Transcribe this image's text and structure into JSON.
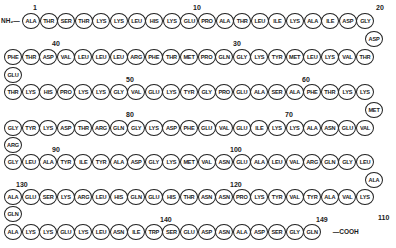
{
  "n_terminus": "NH₂—",
  "c_terminus": "—COOH",
  "rows": [
    {
      "y": 21,
      "residues": [
        "ALA",
        "THR",
        "SER",
        "THR",
        "LYS",
        "LYS",
        "LEU",
        "HIS",
        "LYS",
        "GLU",
        "PRO",
        "ALA",
        "THR",
        "LEU",
        "ILE",
        "LYS",
        "ALA",
        "ILE",
        "ASP",
        "GLY"
      ]
    },
    {
      "y": 57,
      "residues": [
        "PHE",
        "THR",
        "ASP",
        "VAL",
        "LEU",
        "LEU",
        "LEU",
        "ARG",
        "PHE",
        "THR",
        "MET",
        "PRO",
        "GLN",
        "GLY",
        "LYS",
        "TYR",
        "MET",
        "LEU",
        "LYS",
        "VAL",
        "THR"
      ]
    },
    {
      "y": 92,
      "residues": [
        "THR",
        "LYS",
        "HIS",
        "PRO",
        "LYS",
        "LYS",
        "GLY",
        "VAL",
        "GLU",
        "LYS",
        "TYR",
        "GLY",
        "PRO",
        "GLU",
        "ALA",
        "SER",
        "ALA",
        "PHE",
        "THR",
        "LYS",
        "LYS"
      ]
    },
    {
      "y": 128,
      "residues": [
        "GLY",
        "TYR",
        "LYS",
        "ASP",
        "THR",
        "ARG",
        "GLN",
        "GLY",
        "LYS",
        "ASP",
        "PHE",
        "GLU",
        "VAL",
        "GLU",
        "ILE",
        "LYS",
        "LYS",
        "ALA",
        "ASN",
        "GLU",
        "VAL"
      ]
    },
    {
      "y": 162,
      "residues": [
        "GLY",
        "LEU",
        "ALA",
        "TYR",
        "ILE",
        "TYR",
        "ALA",
        "ASP",
        "GLY",
        "LYS",
        "MET",
        "VAL",
        "ASN",
        "GLU",
        "ALA",
        "LEU",
        "VAL",
        "ARG",
        "GLN",
        "GLY",
        "LEU"
      ]
    },
    {
      "y": 197,
      "residues": [
        "ALA",
        "GLU",
        "SER",
        "LYS",
        "ARG",
        "LEU",
        "HIS",
        "GLN",
        "GLU",
        "HIS",
        "THR",
        "ASN",
        "ASN",
        "PRO",
        "LYS",
        "TYR",
        "VAL",
        "TYR",
        "ALA",
        "VAL",
        "LYS"
      ]
    },
    {
      "y": 232,
      "residues": [
        "ALA",
        "LYS",
        "LYS",
        "GLU",
        "LYS",
        "LEU",
        "ASN",
        "ILE",
        "TRP",
        "SER",
        "GLU",
        "ASP",
        "ASN",
        "ALA",
        "ASP",
        "SER",
        "GLY",
        "GLN"
      ]
    }
  ],
  "connectors": [
    {
      "label": "ASP",
      "x": 374,
      "y": 39
    },
    {
      "label": "GLU",
      "x": 13,
      "y": 75
    },
    {
      "label": "MET",
      "x": 374,
      "y": 110
    },
    {
      "label": "ARG",
      "x": 13,
      "y": 145
    },
    {
      "label": "ALA",
      "x": 374,
      "y": 180
    },
    {
      "label": "GLN",
      "x": 13,
      "y": 214
    }
  ],
  "numbers": [
    {
      "label": "1",
      "x": 33,
      "y": 4
    },
    {
      "label": "10",
      "x": 193,
      "y": 4
    },
    {
      "label": "20",
      "x": 376,
      "y": 4
    },
    {
      "label": "30",
      "x": 233,
      "y": 40
    },
    {
      "label": "40",
      "x": 52,
      "y": 40
    },
    {
      "label": "50",
      "x": 126,
      "y": 76
    },
    {
      "label": "60",
      "x": 302,
      "y": 76
    },
    {
      "label": "70",
      "x": 285,
      "y": 111
    },
    {
      "label": "80",
      "x": 126,
      "y": 111
    },
    {
      "label": "90",
      "x": 52,
      "y": 146
    },
    {
      "label": "100",
      "x": 230,
      "y": 146
    },
    {
      "label": "110",
      "x": 378,
      "y": 214
    },
    {
      "label": "120",
      "x": 230,
      "y": 181
    },
    {
      "label": "130",
      "x": 16,
      "y": 181
    },
    {
      "label": "140",
      "x": 160,
      "y": 216
    },
    {
      "label": "149",
      "x": 316,
      "y": 216
    }
  ]
}
